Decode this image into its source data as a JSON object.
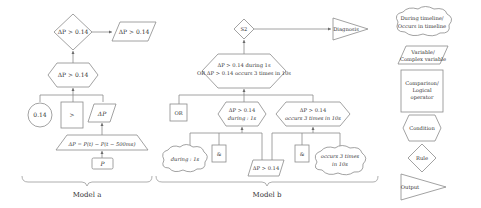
{
  "model_a": {
    "label": "Model a",
    "rule_diamond": "ΔP > 0.14",
    "output_parallelogram": "ΔP > 0.14",
    "condition_hexagon": "ΔP > 0.14",
    "constant_circle": "0.14",
    "operator_box": ">",
    "variable_parallelogram": "ΔP",
    "formula_trapezoid": "ΔP = P(t) − P(t − 500ms)",
    "input_box": "P"
  },
  "model_b": {
    "label": "Model b",
    "rule_diamond": "S2",
    "output_triangle": "Diagnosis",
    "condition_hexagon_line1": "ΔP > 0.14 during 1s",
    "condition_hexagon_line2": "OR ΔP > 0.14 occurs 3 times in 10s",
    "or_box": "OR",
    "left_hexagon_line1": "ΔP > 0.14",
    "left_hexagon_line2": "during : 1s",
    "right_hexagon_line1": "ΔP > 0.14",
    "right_hexagon_line2": "occurs 3 times in 10s",
    "left_cloud": "during : 1s",
    "left_and_box": "&",
    "variable_parallelogram": "ΔP > 0.14",
    "right_and_box": "&",
    "right_cloud_line1": "occurs 3 times",
    "right_cloud_line2": "in 10s"
  },
  "legend": {
    "timeline_cloud_line1": "During timeline/",
    "timeline_cloud_line2": "Occurs in timeline",
    "variable_line1": "Variable/",
    "variable_line2": "Complex variable",
    "operator_line1": "Comparison/",
    "operator_line2": "Logical",
    "operator_line3": "operator",
    "condition": "Condition",
    "rule": "Rule",
    "output": "Output"
  },
  "colors": {
    "stroke": "#8a8a8a",
    "text": "#333333",
    "background": "#ffffff"
  }
}
